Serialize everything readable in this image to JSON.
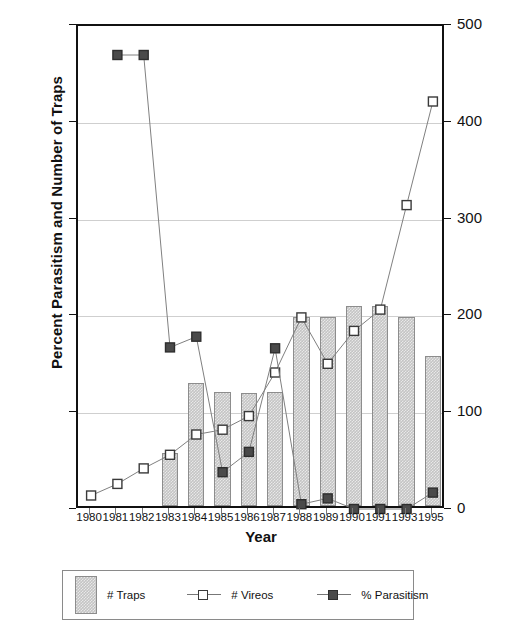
{
  "chart_data": {
    "type": "bar",
    "title": "",
    "xlabel": "Year",
    "ylabel": "Percent Parasitism and Number of Traps",
    "y2label": "Number of Vireos",
    "categories": [
      "1980",
      "1981",
      "1982",
      "1983",
      "1984",
      "1985",
      "1986",
      "1987",
      "1988",
      "1989",
      "1990",
      "1991",
      "1993",
      "1995"
    ],
    "ylim": [
      0,
      50
    ],
    "y2lim": [
      0,
      500
    ],
    "yticks": [
      "0",
      "10",
      "20",
      "30",
      "40",
      "50"
    ],
    "y2ticks": [
      "0",
      "100",
      "200",
      "300",
      "400",
      "500"
    ],
    "grid": true,
    "legend_position": "below",
    "series": [
      {
        "name": "# Traps",
        "kind": "bar",
        "axis": "left",
        "color": "#c4c4c4",
        "values": [
          null,
          null,
          null,
          5.5,
          12.7,
          11.8,
          11.7,
          11.8,
          19.5,
          19.5,
          20.7,
          20.7,
          19.5,
          15.5
        ]
      },
      {
        "name": "# Vireos",
        "kind": "line",
        "axis": "right",
        "marker": "open-square",
        "color": "#3a3a3a",
        "values": [
          15,
          27,
          43,
          57,
          78,
          83,
          97,
          142,
          199,
          151,
          185,
          207,
          315,
          422
        ]
      },
      {
        "name": "% Parasitism",
        "kind": "line",
        "axis": "left",
        "marker": "filled-square",
        "color": "#4a4a4a",
        "values": [
          null,
          47,
          47,
          16.8,
          17.9,
          3.9,
          6.0,
          16.7,
          0.6,
          1.2,
          0.1,
          0.1,
          0.1,
          1.8
        ]
      }
    ]
  },
  "legend": {
    "items": [
      {
        "label": "# Traps",
        "symbol": "bar-swatch"
      },
      {
        "label": "# Vireos",
        "symbol": "open-square-line"
      },
      {
        "label": "% Parasitism",
        "symbol": "filled-square-line"
      }
    ]
  }
}
